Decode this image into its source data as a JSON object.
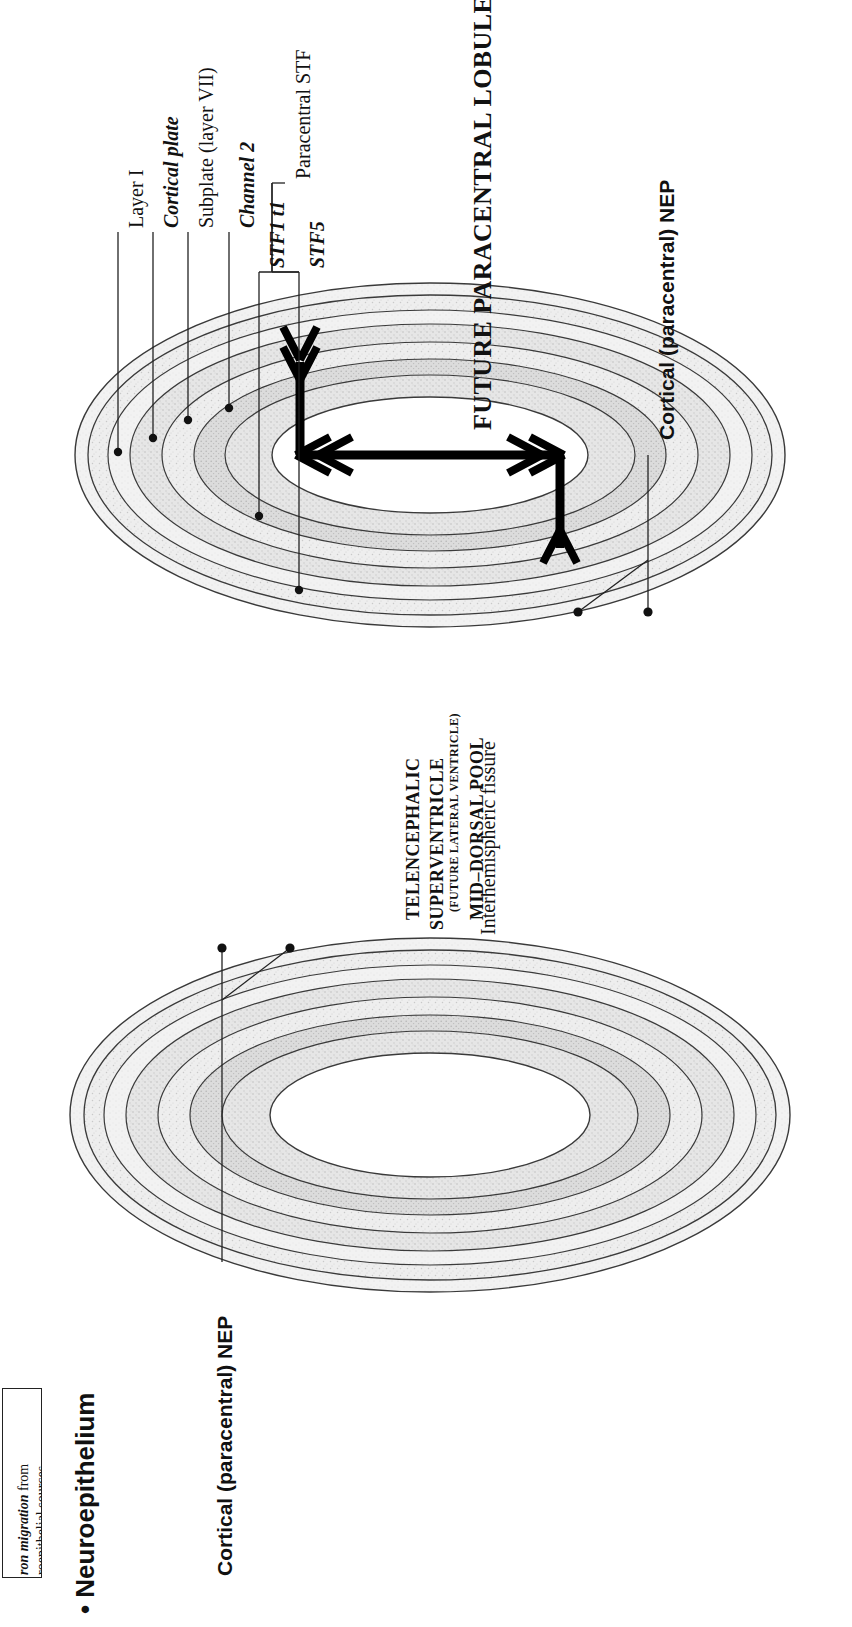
{
  "figure": {
    "title": "FUTURE PARACENTRAL LOBULE",
    "orientation": "rotated-90-ccw"
  },
  "labels": {
    "layer_i": "Layer I",
    "cortical_plate": "Cortical plate",
    "subplate": "Subplate (layer VII)",
    "channel_2": "Channel 2",
    "stf1_t1": "STF1 t1",
    "stf5": "STF5",
    "paracentral_stf": "Paracentral STF",
    "interhemispheric_fissure": "Interhemispheric fissure",
    "cortical_nep_top": "Cortical (paracentral) NEP",
    "cortical_nep_bottom": "Cortical (paracentral) NEP"
  },
  "ventricle": {
    "line1": "TELENCEPHALIC",
    "line2": "SUPERVENTRICLE",
    "line3": "(FUTURE LATERAL VENTRICLE)",
    "line4": "MID–DORSAL POOL"
  },
  "sidebar": {
    "heading": "Neuroepithelium",
    "caption_line1": "ron migration from",
    "caption_line2": "roepithelial sources."
  },
  "colors": {
    "ink": "#111111",
    "outline": "#333333",
    "tissue_light": "#efefef",
    "tissue_mid": "#e2e2e2",
    "tissue_dark": "#d2d2d2",
    "white": "#ffffff"
  },
  "arrows": {
    "count": 4,
    "directions": [
      "up",
      "down",
      "left",
      "right"
    ],
    "meaning": "neuron migration"
  }
}
